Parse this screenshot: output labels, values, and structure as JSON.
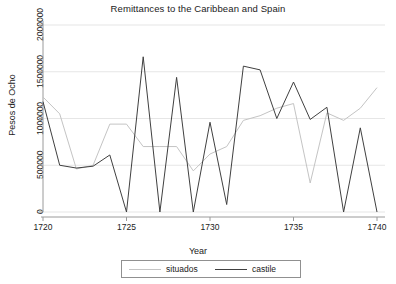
{
  "chart_data": {
    "type": "line",
    "title": "Remittances to the Caribbean and Spain",
    "xlabel": "Year",
    "ylabel": "Pesos de Ocho",
    "xlim": [
      1720,
      1740
    ],
    "ylim": [
      0,
      2100000
    ],
    "grid": "horizontal",
    "legend_position": "below",
    "xticks": [
      1720,
      1725,
      1730,
      1735,
      1740
    ],
    "xtick_labels": [
      "1720",
      "1725",
      "1730",
      "1735",
      "1740"
    ],
    "yticks": [
      0,
      500000,
      1000000,
      1500000,
      2000000
    ],
    "ytick_labels": [
      "0",
      "500000",
      "1000000",
      "1500000",
      "2000000"
    ],
    "x": [
      1720,
      1721,
      1722,
      1723,
      1724,
      1725,
      1726,
      1727,
      1728,
      1729,
      1730,
      1731,
      1732,
      1733,
      1734,
      1735,
      1736,
      1737,
      1738,
      1739,
      1740
    ],
    "series": [
      {
        "name": "situados",
        "color": "#c4c4c4",
        "values": [
          1230000,
          1050000,
          460000,
          500000,
          940000,
          940000,
          700000,
          700000,
          700000,
          440000,
          620000,
          700000,
          980000,
          1030000,
          1110000,
          1160000,
          310000,
          1060000,
          980000,
          1110000,
          1330000
        ]
      },
      {
        "name": "castile",
        "color": "#404040",
        "values": [
          1180000,
          500000,
          470000,
          490000,
          610000,
          0,
          1660000,
          0,
          1440000,
          0,
          960000,
          80000,
          1560000,
          1520000,
          1000000,
          1390000,
          990000,
          1120000,
          0,
          900000,
          0
        ]
      }
    ]
  },
  "legend": {
    "entries": [
      {
        "label": "situados"
      },
      {
        "label": "castile"
      }
    ]
  }
}
